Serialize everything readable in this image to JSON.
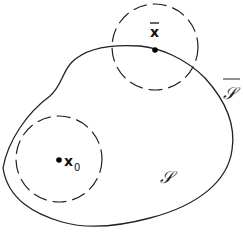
{
  "diagram": {
    "title": "",
    "region": {
      "label": "𝒮",
      "closure_label": "𝒮",
      "closure_bar": true
    },
    "points": [
      {
        "id": "x_bar",
        "label": "x",
        "has_bar": true,
        "location": "boundary",
        "neighborhood": "dashed circle"
      },
      {
        "id": "x_0",
        "label": "x",
        "subscript": "0",
        "location": "interior",
        "neighborhood": "dashed circle"
      }
    ],
    "colors": {
      "stroke": "#222222",
      "background": "#ffffff"
    }
  }
}
